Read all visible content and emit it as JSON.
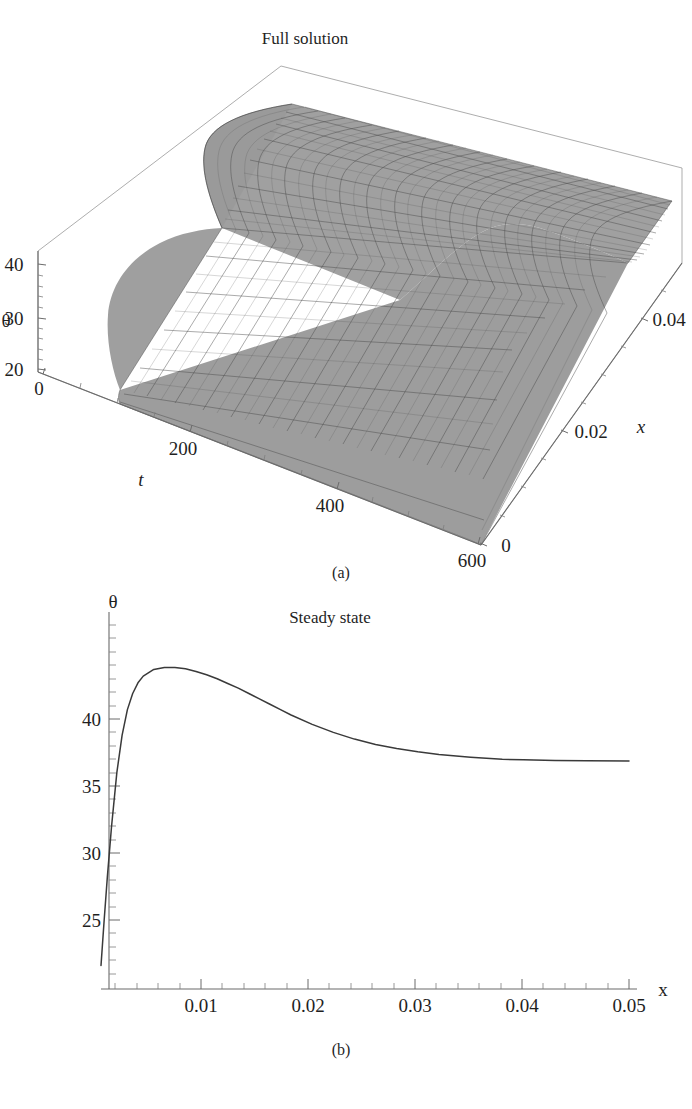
{
  "figure": {
    "panels": [
      {
        "id": "a",
        "caption": "(a)",
        "title": "Full solution",
        "type": "surface3d"
      },
      {
        "id": "b",
        "caption": "(b)",
        "title": "Steady state",
        "type": "line"
      }
    ]
  },
  "chart_data": [
    {
      "type": "surface",
      "title": "Full solution",
      "subfigure": "(a)",
      "xlabel": "t",
      "ylabel": "x",
      "zlabel": "θ",
      "xticks": [
        0,
        200,
        400,
        600
      ],
      "xtick_labels": [
        "0",
        "200",
        "400",
        "600"
      ],
      "yticks": [
        0,
        0.02,
        0.04
      ],
      "ytick_labels": [
        "0",
        "0.02",
        "0.04"
      ],
      "zticks": [
        20,
        30,
        40
      ],
      "ztick_labels": [
        "20",
        "30",
        "40"
      ],
      "xlim": [
        0,
        600
      ],
      "ylim": [
        0,
        0.05
      ],
      "zlim": [
        17,
        44
      ],
      "grid": true,
      "mesh": true,
      "surface_color": "#a0a0a0",
      "mesh_color": "#4a4a4a",
      "description": "Theta(x,t) rises rapidly in t from initial value ~20 to the steady profile; in x it shows a sharp boundary spike near x=0 then a plateau near 37.",
      "t_samples": [
        0,
        10,
        20,
        40,
        60,
        100,
        150,
        200,
        300,
        400,
        500,
        600
      ],
      "x_samples": [
        0,
        0.002,
        0.004,
        0.006,
        0.008,
        0.01,
        0.015,
        0.02,
        0.025,
        0.03,
        0.035,
        0.04,
        0.045,
        0.05
      ],
      "theta_initial": 20,
      "theta_plateau": 37,
      "theta_peak": 43.8
    },
    {
      "type": "line",
      "title": "Steady state",
      "subfigure": "(b)",
      "xlabel": "x",
      "ylabel": "θ",
      "xticks": [
        0.01,
        0.02,
        0.03,
        0.04,
        0.05
      ],
      "xtick_labels": [
        "0.01",
        "0.02",
        "0.03",
        "0.04",
        "0.05"
      ],
      "xminor_count": 4,
      "yticks": [
        25,
        30,
        35,
        40
      ],
      "ytick_labels": [
        "25",
        "30",
        "35",
        "40"
      ],
      "yminor_count": 4,
      "xlim": [
        0,
        0.05
      ],
      "ylim": [
        21.5,
        45.5
      ],
      "grid": false,
      "legend": false,
      "line_color": "#3a3a3a",
      "x": [
        0.0,
        0.0003,
        0.0006,
        0.001,
        0.0015,
        0.002,
        0.0025,
        0.003,
        0.0035,
        0.004,
        0.005,
        0.006,
        0.007,
        0.008,
        0.009,
        0.01,
        0.011,
        0.012,
        0.013,
        0.014,
        0.015,
        0.016,
        0.017,
        0.018,
        0.02,
        0.022,
        0.024,
        0.026,
        0.028,
        0.03,
        0.032,
        0.035,
        0.038,
        0.04,
        0.043,
        0.046,
        0.05
      ],
      "y": [
        21.6,
        25.0,
        28.2,
        32.0,
        36.0,
        38.8,
        40.7,
        41.9,
        42.7,
        43.2,
        43.7,
        43.85,
        43.85,
        43.75,
        43.55,
        43.3,
        43.0,
        42.65,
        42.3,
        41.9,
        41.5,
        41.1,
        40.7,
        40.3,
        39.6,
        39.0,
        38.5,
        38.1,
        37.8,
        37.55,
        37.35,
        37.15,
        37.0,
        36.95,
        36.9,
        36.88,
        36.87
      ]
    }
  ]
}
